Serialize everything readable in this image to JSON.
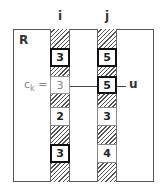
{
  "diagram": {
    "region_label": "R",
    "columns": [
      {
        "label": "i",
        "cells": [
          {
            "value": "3",
            "style": "bold"
          },
          {
            "value": "3",
            "style": "gray"
          },
          {
            "value": "2",
            "style": "thin"
          },
          {
            "value": "3",
            "style": "bold"
          }
        ]
      },
      {
        "label": "j",
        "cells": [
          {
            "value": "5",
            "style": "bold"
          },
          {
            "value": "5",
            "style": "bold"
          },
          {
            "value": "3",
            "style": "thin"
          },
          {
            "value": "4",
            "style": "thin"
          }
        ]
      }
    ],
    "left_annotation": {
      "text": "c",
      "subscript": "k",
      "suffix": "="
    },
    "right_annotation": "u"
  }
}
